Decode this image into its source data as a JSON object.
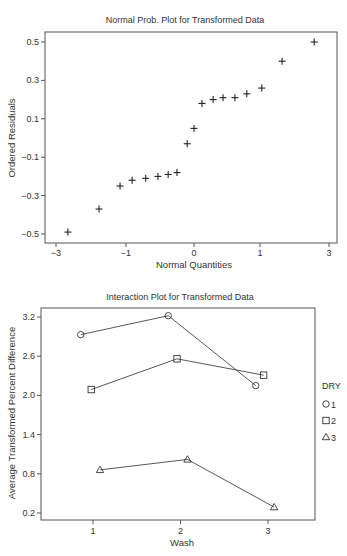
{
  "chart_data": [
    {
      "type": "scatter",
      "title": "Normal Prob. Plot for Transformed Data",
      "xlabel": "Normal Quantities",
      "ylabel": "Ordered Residuals",
      "x_ticks": [
        "-3",
        "-1",
        "0",
        "1",
        "3"
      ],
      "y_ticks": [
        "0.5",
        "0.3",
        "0.1",
        "-0.1",
        "-0.3",
        "-0.5"
      ],
      "ylim": [
        -0.55,
        0.55
      ],
      "grid": false,
      "marker": "plus",
      "points": [
        {
          "x": -2.66,
          "y": -0.49
        },
        {
          "x": -1.77,
          "y": -0.37
        },
        {
          "x": -1.17,
          "y": -0.25
        },
        {
          "x": -0.91,
          "y": -0.22
        },
        {
          "x": -0.71,
          "y": -0.21
        },
        {
          "x": -0.53,
          "y": -0.2
        },
        {
          "x": -0.38,
          "y": -0.19
        },
        {
          "x": -0.25,
          "y": -0.18
        },
        {
          "x": -0.1,
          "y": -0.03
        },
        {
          "x": 0.0,
          "y": 0.05
        },
        {
          "x": 0.12,
          "y": 0.18
        },
        {
          "x": 0.29,
          "y": 0.2
        },
        {
          "x": 0.44,
          "y": 0.21
        },
        {
          "x": 0.62,
          "y": 0.21
        },
        {
          "x": 0.8,
          "y": 0.23
        },
        {
          "x": 1.05,
          "y": 0.26
        },
        {
          "x": 1.64,
          "y": 0.4
        },
        {
          "x": 2.57,
          "y": 0.5
        }
      ]
    },
    {
      "type": "line",
      "title": "Interaction Plot for Transformed Data",
      "xlabel": "Wash",
      "ylabel": "Average Transformed Percent Difference",
      "categories": [
        "1",
        "2",
        "3"
      ],
      "y_ticks": [
        "3.2",
        "2.6",
        "2.0",
        "1.4",
        "0.8",
        "0.2"
      ],
      "ylim": [
        0.1,
        3.3
      ],
      "grid": false,
      "legend": {
        "title": "DRY",
        "position": "right"
      },
      "series": [
        {
          "name": "1",
          "marker": "circle",
          "x": [
            0.86,
            1.86,
            2.86
          ],
          "values": [
            2.93,
            3.22,
            2.15
          ]
        },
        {
          "name": "2",
          "marker": "square",
          "x": [
            0.98,
            1.96,
            2.95
          ],
          "values": [
            2.09,
            2.56,
            2.31
          ]
        },
        {
          "name": "3",
          "marker": "triangle",
          "x": [
            1.08,
            2.08,
            3.07
          ],
          "values": [
            0.86,
            1.02,
            0.29
          ]
        }
      ]
    }
  ]
}
